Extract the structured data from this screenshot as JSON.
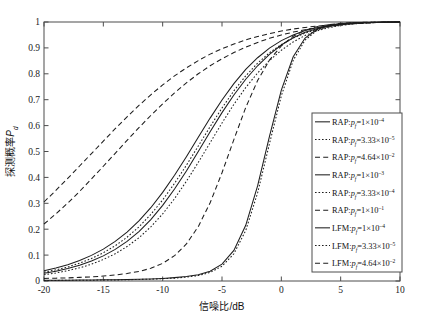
{
  "chart_data": {
    "type": "line",
    "title": "",
    "xlabel": "信噪比/dB",
    "ylabel": "探测概率P_d",
    "xlim": [
      -20,
      10
    ],
    "ylim": [
      0,
      1
    ],
    "xticks": [
      -20,
      -15,
      -10,
      -5,
      0,
      5,
      10
    ],
    "xticklabels": [
      "-20",
      "-15",
      "-10",
      "-5",
      "0",
      "5",
      "10"
    ],
    "yticks": [
      0,
      0.1,
      0.2,
      0.3,
      0.4,
      0.5,
      0.6,
      0.7,
      0.8,
      0.9,
      1
    ],
    "yticklabels": [
      "0",
      "0.1",
      "0.2",
      "0.3",
      "0.4",
      "0.5",
      "0.6",
      "0.7",
      "0.8",
      "0.9",
      "1"
    ],
    "grid": false,
    "legend_position": "lower-right-inside",
    "x": [
      -20,
      -19,
      -18,
      -17,
      -16,
      -15,
      -14,
      -13,
      -12,
      -11,
      -10,
      -9,
      -8,
      -7,
      -6,
      -5,
      -4,
      -3,
      -2,
      -1,
      0,
      1,
      2,
      3,
      4,
      5,
      6,
      7,
      8,
      9,
      10
    ],
    "series": [
      {
        "name": "RAP:p_f=1×10^-4",
        "method": "RAP",
        "pf": "1×10⁻⁴",
        "style": "solid",
        "values": [
          0.03,
          0.038,
          0.048,
          0.061,
          0.077,
          0.097,
          0.122,
          0.153,
          0.191,
          0.237,
          0.292,
          0.355,
          0.425,
          0.5,
          0.576,
          0.65,
          0.718,
          0.779,
          0.831,
          0.875,
          0.911,
          0.939,
          0.96,
          0.974,
          0.984,
          0.99,
          0.994,
          0.997,
          0.998,
          0.999,
          1.0
        ]
      },
      {
        "name": "RAP:p_f=3.33×10^-5",
        "method": "RAP",
        "pf": "3.33×10⁻⁵",
        "style": "dotted",
        "values": [
          0.024,
          0.031,
          0.04,
          0.051,
          0.065,
          0.083,
          0.105,
          0.133,
          0.167,
          0.209,
          0.259,
          0.318,
          0.385,
          0.458,
          0.534,
          0.61,
          0.682,
          0.747,
          0.803,
          0.851,
          0.891,
          0.923,
          0.948,
          0.966,
          0.978,
          0.987,
          0.992,
          0.996,
          0.998,
          0.999,
          1.0
        ]
      },
      {
        "name": "RAP:p_f=4.64×10^-2",
        "method": "RAP",
        "pf": "4.64×10⁻²",
        "style": "dashed",
        "values": [
          0.22,
          0.259,
          0.301,
          0.346,
          0.394,
          0.443,
          0.493,
          0.543,
          0.592,
          0.639,
          0.684,
          0.726,
          0.765,
          0.8,
          0.831,
          0.858,
          0.882,
          0.903,
          0.921,
          0.937,
          0.95,
          0.961,
          0.97,
          0.978,
          0.984,
          0.989,
          0.993,
          0.996,
          0.998,
          0.999,
          1.0
        ]
      },
      {
        "name": "RAP:p_f=1×10^-3",
        "method": "RAP",
        "pf": "1×10⁻³",
        "style": "solid",
        "values": [
          0.04,
          0.05,
          0.063,
          0.079,
          0.099,
          0.123,
          0.153,
          0.189,
          0.232,
          0.283,
          0.342,
          0.408,
          0.48,
          0.555,
          0.629,
          0.699,
          0.762,
          0.817,
          0.862,
          0.899,
          0.928,
          0.95,
          0.967,
          0.978,
          0.986,
          0.992,
          0.995,
          0.997,
          0.999,
          0.999,
          1.0
        ]
      },
      {
        "name": "RAP:p_f=3.33×10^-4",
        "method": "RAP",
        "pf": "3.33×10⁻⁴",
        "style": "dotted",
        "values": [
          0.034,
          0.043,
          0.054,
          0.069,
          0.087,
          0.109,
          0.136,
          0.169,
          0.209,
          0.257,
          0.313,
          0.377,
          0.447,
          0.521,
          0.596,
          0.668,
          0.734,
          0.792,
          0.841,
          0.881,
          0.913,
          0.938,
          0.957,
          0.971,
          0.981,
          0.988,
          0.993,
          0.996,
          0.998,
          0.999,
          1.0
        ]
      },
      {
        "name": "RAP:p_f=1×10^-1",
        "method": "RAP",
        "pf": "1×10⁻¹",
        "style": "dashed",
        "values": [
          0.305,
          0.35,
          0.396,
          0.444,
          0.492,
          0.54,
          0.588,
          0.634,
          0.678,
          0.719,
          0.757,
          0.792,
          0.823,
          0.851,
          0.876,
          0.897,
          0.915,
          0.931,
          0.944,
          0.955,
          0.965,
          0.973,
          0.979,
          0.984,
          0.989,
          0.992,
          0.995,
          0.997,
          0.998,
          0.999,
          1.0
        ]
      },
      {
        "name": "LFM:p_f=1×10^-4",
        "method": "LFM",
        "pf": "1×10⁻⁴",
        "style": "solid",
        "values": [
          0.003,
          0.003,
          0.003,
          0.004,
          0.004,
          0.005,
          0.005,
          0.006,
          0.007,
          0.008,
          0.01,
          0.013,
          0.017,
          0.024,
          0.038,
          0.065,
          0.118,
          0.215,
          0.367,
          0.558,
          0.737,
          0.866,
          0.938,
          0.972,
          0.987,
          0.994,
          0.997,
          0.998,
          0.999,
          1.0,
          1.0
        ]
      },
      {
        "name": "LFM:p_f=3.33×10^-5",
        "method": "LFM",
        "pf": "3.33×10⁻⁵",
        "style": "dotted",
        "values": [
          0.002,
          0.002,
          0.003,
          0.003,
          0.003,
          0.004,
          0.004,
          0.005,
          0.006,
          0.007,
          0.009,
          0.011,
          0.015,
          0.021,
          0.033,
          0.057,
          0.105,
          0.195,
          0.34,
          0.53,
          0.715,
          0.852,
          0.93,
          0.968,
          0.985,
          0.993,
          0.997,
          0.998,
          0.999,
          1.0,
          1.0
        ]
      },
      {
        "name": "LFM:p_f=4.64×10^-2",
        "method": "LFM",
        "pf": "4.64×10⁻²",
        "style": "dashed",
        "values": [
          0.01,
          0.011,
          0.012,
          0.014,
          0.016,
          0.019,
          0.023,
          0.029,
          0.037,
          0.049,
          0.068,
          0.098,
          0.143,
          0.21,
          0.302,
          0.418,
          0.546,
          0.67,
          0.774,
          0.853,
          0.908,
          0.945,
          0.968,
          0.982,
          0.99,
          0.995,
          0.997,
          0.999,
          0.999,
          1.0,
          1.0
        ]
      }
    ],
    "legend_entries": [
      {
        "style": "solid",
        "method": "RAP",
        "pf_text": "1×10",
        "exp": "–4"
      },
      {
        "style": "dotted",
        "method": "RAP",
        "pf_text": "3.33×10",
        "exp": "–5"
      },
      {
        "style": "dashed",
        "method": "RAP",
        "pf_text": "4.64×10",
        "exp": "–2"
      },
      {
        "style": "solid",
        "method": "RAP",
        "pf_text": "1×10",
        "exp": "–3"
      },
      {
        "style": "dotted",
        "method": "RAP",
        "pf_text": "3.33×10",
        "exp": "–4"
      },
      {
        "style": "dashed",
        "method": "RAP",
        "pf_text": "1×10",
        "exp": "–1"
      },
      {
        "style": "solid",
        "method": "LFM",
        "pf_text": "1×10",
        "exp": "–4"
      },
      {
        "style": "dotted",
        "method": "LFM",
        "pf_text": "3.33×10",
        "exp": "–5"
      },
      {
        "style": "dashed",
        "method": "LFM",
        "pf_text": "4.64×10",
        "exp": "–2"
      }
    ],
    "colors": {
      "line": "#1d1d1d",
      "axis": "#4d4d4d",
      "background": "#ffffff"
    }
  },
  "axis": {
    "x_label": "信噪比/dB",
    "y_label_main": "探测概率",
    "y_label_sym": "P",
    "y_label_sub": "d"
  }
}
